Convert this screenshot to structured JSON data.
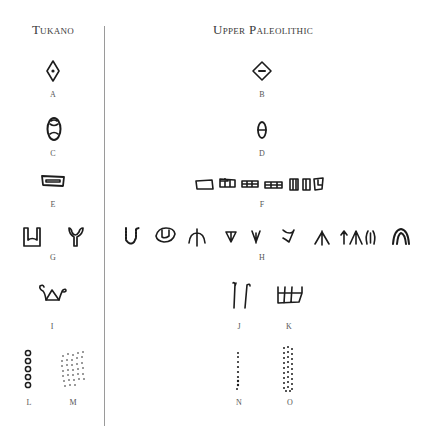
{
  "headings": {
    "left": "Tukano",
    "right": "Upper Paleolithic"
  },
  "labels": {
    "A": "A",
    "B": "B",
    "C": "C",
    "D": "D",
    "E": "E",
    "F": "F",
    "G": "G",
    "H": "H",
    "I": "I",
    "J": "J",
    "K": "K",
    "L": "L",
    "M": "M",
    "N": "N",
    "O": "O"
  },
  "glyphs": [
    {
      "id": "A",
      "column": "Tukano",
      "icon": "diamond-with-dot"
    },
    {
      "id": "B",
      "column": "Upper Paleolithic",
      "icon": "diamond-with-dash"
    },
    {
      "id": "C",
      "column": "Tukano",
      "icon": "oval-with-inner-hourglass"
    },
    {
      "id": "D",
      "column": "Upper Paleolithic",
      "icon": "oval-with-bar"
    },
    {
      "id": "E",
      "column": "Tukano",
      "icon": "rectangle-with-inner-bar"
    },
    {
      "id": "F",
      "column": "Upper Paleolithic",
      "icon": "row-of-segmented-rectangles",
      "count": 7
    },
    {
      "id": "G",
      "column": "Tukano",
      "icon": "u-shape-and-y-shape",
      "count": 2
    },
    {
      "id": "H",
      "column": "Upper Paleolithic",
      "icon": "row-of-u-v-and-arrow-signs",
      "count": 10
    },
    {
      "id": "I",
      "column": "Tukano",
      "icon": "triangle-with-spirals"
    },
    {
      "id": "J",
      "column": "Upper Paleolithic",
      "icon": "two-vertical-hooks"
    },
    {
      "id": "K",
      "column": "Upper Paleolithic",
      "icon": "comb-ladder-sign"
    },
    {
      "id": "L",
      "column": "Tukano",
      "icon": "vertical-column-of-circles",
      "count": 5
    },
    {
      "id": "M",
      "column": "Tukano",
      "icon": "dot-grid"
    },
    {
      "id": "N",
      "column": "Upper Paleolithic",
      "icon": "vertical-line-of-dots"
    },
    {
      "id": "O",
      "column": "Upper Paleolithic",
      "icon": "dense-dot-column"
    }
  ]
}
